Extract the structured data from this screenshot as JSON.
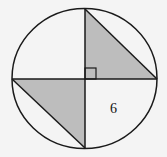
{
  "diagram": {
    "label_6": "6",
    "colors": {
      "stroke": "#1a1a1a",
      "shade": "#bdbdbd",
      "background": "#f4f4f4"
    }
  }
}
